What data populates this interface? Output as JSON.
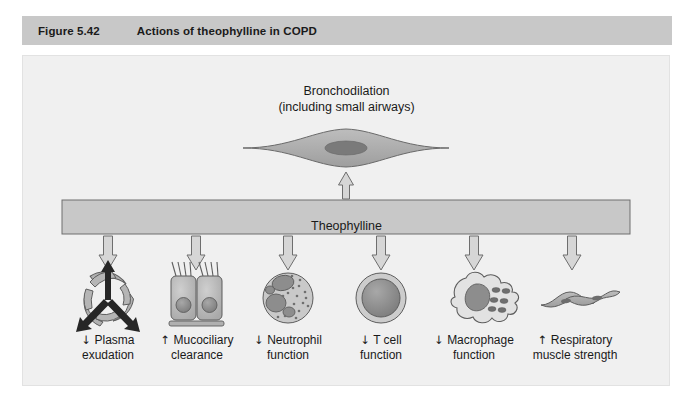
{
  "header": {
    "figure_number": "Figure 5.42",
    "title": "Actions of theophylline in COPD",
    "bar_color": "#c8c8c8"
  },
  "panel": {
    "background": "#f0f0f0",
    "border_color": "#e2e2e2"
  },
  "diagram": {
    "top_node": {
      "line1": "Bronchodilation",
      "line2": "(including small airways)",
      "icon": "airway-smooth-muscle-cell-icon"
    },
    "central_bar": {
      "label": "Theophylline",
      "fill": "#c8c8c8",
      "stroke": "#6e6e6e"
    },
    "up_arrow": {
      "name": "up-arrow-to-bronchodilation",
      "direction": "up",
      "style": "hollow-outline"
    },
    "effects": [
      {
        "icon": "plasma-exudation-endothelium-icon",
        "direction": "down",
        "arrow_glyph": "↓",
        "line1": "Plasma",
        "line2": "exudation"
      },
      {
        "icon": "ciliated-epithelial-cells-icon",
        "direction": "up",
        "arrow_glyph": "↑",
        "line1": "Mucociliary",
        "line2": "clearance"
      },
      {
        "icon": "neutrophil-cell-icon",
        "direction": "down",
        "arrow_glyph": "↓",
        "line1": "Neutrophil",
        "line2": "function"
      },
      {
        "icon": "t-cell-icon",
        "direction": "down",
        "arrow_glyph": "↓",
        "line1": "T cell",
        "line2": "function"
      },
      {
        "icon": "macrophage-cell-icon",
        "direction": "down",
        "arrow_glyph": "↓",
        "line1": "Macrophage",
        "line2": "function"
      },
      {
        "icon": "respiratory-muscle-cells-icon",
        "direction": "up",
        "arrow_glyph": "↑",
        "line1": "Respiratory",
        "line2": "muscle strength"
      }
    ],
    "colors": {
      "cell_fill": "#b4b4b4",
      "cell_fill_light": "#c6c6c6",
      "nucleus_fill": "#8a8a8a",
      "outline": "#5a5a5a",
      "arrow_fill": "#d2d2d2",
      "arrow_stroke": "#6e6e6e",
      "solid_arrow": "#2b2b2b"
    }
  }
}
